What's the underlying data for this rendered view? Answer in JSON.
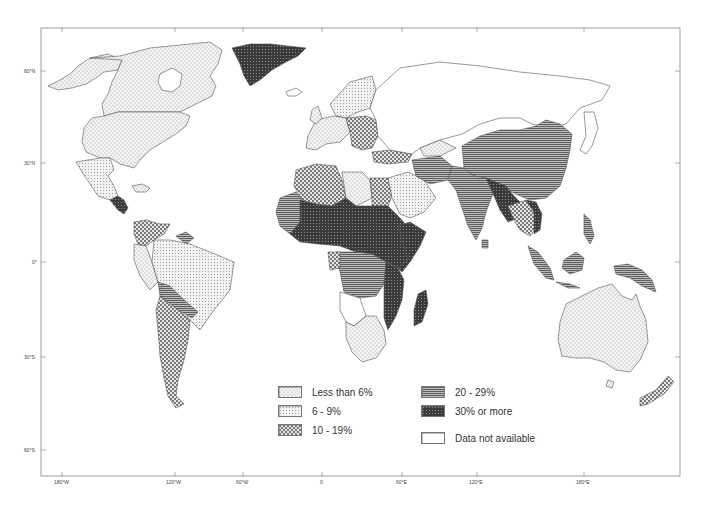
{
  "map": {
    "frame": {
      "left": 41,
      "top": 28,
      "right": 680,
      "bottom": 476
    },
    "lat_ticks": [
      {
        "label": "60°N",
        "y": 71
      },
      {
        "label": "30°N",
        "y": 163
      },
      {
        "label": "0°",
        "y": 262
      },
      {
        "label": "30°S",
        "y": 357
      },
      {
        "label": "60°S",
        "y": 450
      }
    ],
    "lon_ticks": [
      {
        "label": "180°W",
        "x": 62
      },
      {
        "label": "120°W",
        "x": 175
      },
      {
        "label": "60°W",
        "x": 243
      },
      {
        "label": "0",
        "x": 322
      },
      {
        "label": "60°E",
        "x": 402
      },
      {
        "label": "120°E",
        "x": 477
      },
      {
        "label": "180°E",
        "x": 584
      }
    ],
    "colors": {
      "outline": "#555555",
      "background": "#ffffff",
      "less_than_6": "#e8e8e8",
      "six_to_nine": "#dcdcdc",
      "ten_to_19": "#c8c8c8",
      "twenty_to_29": "#8a8a8a",
      "thirty_plus": "#3c3c3c",
      "na": "#ffffff"
    }
  },
  "legend": {
    "items": [
      {
        "id": "lt6",
        "label": "Less than 6%",
        "pattern": "fine-dots"
      },
      {
        "id": "6to9",
        "label": "6 - 9%",
        "pattern": "grid-dots"
      },
      {
        "id": "10to19",
        "label": "10 - 19%",
        "pattern": "coarse-dots"
      },
      {
        "id": "20to29",
        "label": "20 - 29%",
        "pattern": "horizontal-lines"
      },
      {
        "id": "30plus",
        "label": "30% or more",
        "pattern": "dark-crosshatch"
      },
      {
        "id": "na",
        "label": "Data not available",
        "pattern": "blank"
      }
    ]
  }
}
